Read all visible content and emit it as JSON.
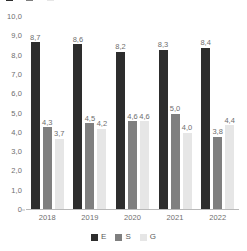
{
  "chart_data": {
    "type": "bar",
    "title": "",
    "xlabel": "",
    "ylabel": "",
    "ylim": [
      0,
      10
    ],
    "ytick_labels": [
      "10,0",
      "9,0",
      "8,0",
      "7,0",
      "6,0",
      "5,0",
      "4,0",
      "3,0",
      "2,0",
      "1,0",
      "0"
    ],
    "ytick_values": [
      10,
      9,
      8,
      7,
      6,
      5,
      4,
      3,
      2,
      1,
      0
    ],
    "grid": false,
    "legend_position": "bottom-center",
    "categories": [
      "2018",
      "2019",
      "2020",
      "2021",
      "2022"
    ],
    "series": [
      {
        "name": "E",
        "color": "#2d2d2d",
        "values": [
          8.7,
          8.6,
          8.2,
          8.3,
          8.4
        ],
        "labels": [
          "8,7",
          "8,6",
          "8,2",
          "8,3",
          "8,4"
        ]
      },
      {
        "name": "S",
        "color": "#7f7f7f",
        "values": [
          4.3,
          4.5,
          4.6,
          5.0,
          3.8
        ],
        "labels": [
          "4,3",
          "4,5",
          "4,6",
          "5,0",
          "3,8"
        ]
      },
      {
        "name": "G",
        "color": "#e6e6e6",
        "values": [
          3.7,
          4.2,
          4.6,
          4.0,
          4.4
        ],
        "labels": [
          "3,7",
          "4,2",
          "4,6",
          "4,0",
          "4,4"
        ]
      }
    ]
  },
  "legend": {
    "items": [
      {
        "label": "E",
        "color": "#2d2d2d"
      },
      {
        "label": "S",
        "color": "#7f7f7f"
      },
      {
        "label": "G",
        "color": "#e6e6e6"
      }
    ]
  },
  "top_fragment": {
    "items": [
      {
        "label": "E",
        "color": "#2d2d2d"
      },
      {
        "label": "S",
        "color": "#7f7f7f"
      },
      {
        "label": "G",
        "color": "#e6e6e6"
      }
    ]
  },
  "colors": {
    "series_e": "#2d2d2d",
    "series_s": "#7f7f7f",
    "series_g": "#e6e6e6",
    "axis": "#b9b9b9",
    "text": "#6e6e6e",
    "background": "#ffffff"
  }
}
